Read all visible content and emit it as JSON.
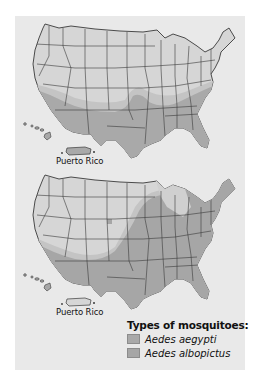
{
  "figure": {
    "maps": [
      {
        "id": "map-aedes-aegypti",
        "species": "Aedes aegypti",
        "shaded_region": "Southern United States (California, Arizona, New Mexico, Texas, Oklahoma, southern Kansas, Gulf states, Southeast, Mid-Atlantic), Hawaii, Puerto Rico",
        "inset_label": "Puerto Rico"
      },
      {
        "id": "map-aedes-albopictus",
        "species": "Aedes albopictus",
        "shaded_region": "Eastern and Southern United States (east of Great Plains, up to New England), Texas, Oklahoma, southern California/Arizona/New Mexico, Hawaii",
        "inset_label": "Puerto Rico"
      }
    ],
    "legend": {
      "title": "Types of mosquitoes:",
      "items": [
        {
          "label": "Aedes aegypti",
          "color": "#a9a9a9"
        },
        {
          "label": "Aedes albopictus",
          "color": "#a6a6a6"
        }
      ]
    }
  },
  "colors": {
    "background": "#ffffff",
    "panel": "#e9e9e9",
    "land_unshaded": "#d6d6d6",
    "land_shaded": "#a9a9a9",
    "land_transition": "#c4c4c4",
    "border": "#3a3a3a"
  }
}
